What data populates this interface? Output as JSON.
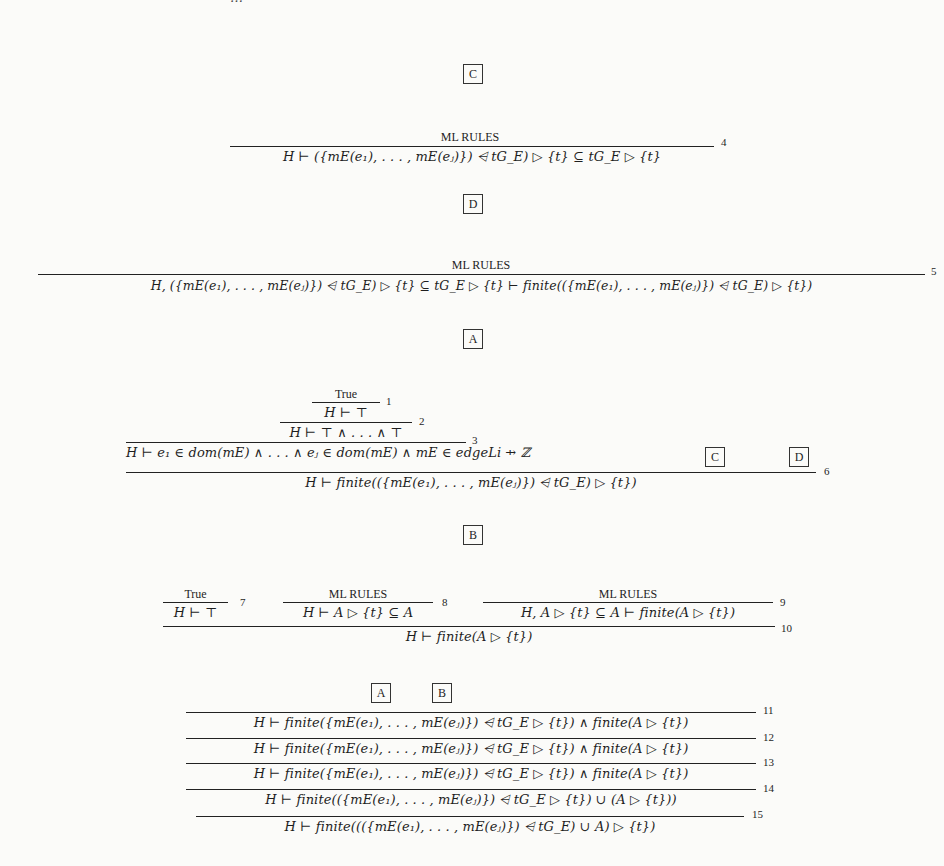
{
  "page": {
    "type": "proof-tree-figure",
    "clipped_top_text": "…"
  },
  "boxes": {
    "top_C": "C",
    "top_D": "D",
    "top_A": "A",
    "mid_C": "C",
    "mid_D": "D",
    "top_B": "B",
    "bottom_A": "A",
    "bottom_B": "B"
  },
  "proof_C": {
    "premise": "ML RULES",
    "conclusion": "H ⊢ ({mE(e₁), . . . , mE(eⱼ)}) ⩤ tG_E) ▷ {t} ⊆ tG_E ▷ {t}",
    "rule_number": "4"
  },
  "proof_D": {
    "premise": "ML RULES",
    "conclusion": "H, ({mE(e₁), . . . , mE(eⱼ)}) ⩤ tG_E) ▷ {t} ⊆ tG_E ▷ {t} ⊢ finite(({mE(e₁), . . . , mE(eⱼ)}) ⩤ tG_E) ▷ {t})",
    "rule_number": "5"
  },
  "proof_A": {
    "step1_premise": "True",
    "step1_conclusion": "H ⊢ ⊤",
    "step1_number": "1",
    "step2_conclusion": "H ⊢ ⊤ ∧ . . . ∧ ⊤",
    "step2_number": "2",
    "step3_conclusion": "H ⊢ e₁ ∈ dom(mE) ∧ . . . ∧ eⱼ ∈ dom(mE) ∧ mE ∈ edgeLi ⇸ ℤ",
    "step3_number": "3",
    "final_conclusion": "H ⊢ finite(({mE(e₁), . . . , mE(eⱼ)}) ⩤ tG_E) ▷ {t})",
    "final_number": "6"
  },
  "proof_B": {
    "left_premise": "True",
    "left_conclusion": "H ⊢ ⊤",
    "left_number": "7",
    "mid_premise": "ML RULES",
    "mid_conclusion": "H ⊢ A ▷ {t} ⊆ A",
    "mid_number": "8",
    "right_premise": "ML RULES",
    "right_conclusion": "H, A ▷ {t} ⊆ A ⊢ finite(A ▷ {t})",
    "right_number": "9",
    "final_conclusion": "H ⊢ finite(A ▷ {t})",
    "final_number": "10"
  },
  "proof_main": {
    "lines": [
      {
        "text": "H ⊢ finite({mE(e₁), . . . , mE(eⱼ)}) ⩤ tG_E ▷ {t}) ∧ finite(A ▷ {t})",
        "number": "11"
      },
      {
        "text": "H ⊢ finite({mE(e₁), . . . , mE(eⱼ)}) ⩤ tG_E ▷ {t}) ∧ finite(A ▷ {t})",
        "number": "12"
      },
      {
        "text": "H ⊢ finite({mE(e₁), . . . , mE(eⱼ)}) ⩤ tG_E ▷ {t}) ∧ finite(A ▷ {t})",
        "number": "13"
      },
      {
        "text": "H ⊢ finite(({mE(e₁), . . . , mE(eⱼ)}) ⩤ tG_E ▷ {t}) ∪ (A ▷ {t}))",
        "number": "14"
      },
      {
        "text": "H ⊢ finite((({mE(e₁), . . . , mE(eⱼ)}) ⩤ tG_E) ∪ A) ▷ {t})",
        "number": "15"
      }
    ]
  }
}
